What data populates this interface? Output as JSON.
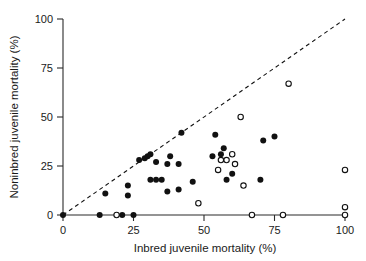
{
  "figure": {
    "background_color": "#ffffff",
    "foreground_color": "#111111"
  },
  "chart_data": {
    "type": "scatter",
    "title": "",
    "xlabel": "Inbred juvenile mortality (%)",
    "ylabel": "Noninbred juvenile mortality (%)",
    "xlim": [
      0,
      100
    ],
    "ylim": [
      0,
      100
    ],
    "xticks": [
      0,
      25,
      50,
      75,
      100
    ],
    "yticks": [
      0,
      25,
      50,
      75,
      100
    ],
    "xtick_labels": [
      "0",
      "25",
      "50",
      "75",
      "100"
    ],
    "ytick_labels": [
      "0",
      "25",
      "50",
      "75",
      "100"
    ],
    "grid": false,
    "legend": "none",
    "annotations": [
      {
        "name": "equality-reference-line",
        "kind": "line",
        "style": "dashed",
        "from": [
          0,
          0
        ],
        "to": [
          100,
          100
        ],
        "description": "1:1 dashed diagonal reference line"
      }
    ],
    "series": [
      {
        "name": "filled-circles",
        "marker": "filled-circle",
        "color": "#111111",
        "points": [
          [
            0,
            0
          ],
          [
            13,
            0
          ],
          [
            21,
            0
          ],
          [
            25,
            0
          ],
          [
            15,
            11
          ],
          [
            23,
            15
          ],
          [
            23,
            10
          ],
          [
            27,
            28
          ],
          [
            29,
            29
          ],
          [
            30,
            30
          ],
          [
            31,
            31
          ],
          [
            31,
            18
          ],
          [
            33,
            27
          ],
          [
            33,
            18
          ],
          [
            35,
            18
          ],
          [
            37,
            26
          ],
          [
            37,
            12
          ],
          [
            38,
            30
          ],
          [
            41,
            26
          ],
          [
            41,
            13
          ],
          [
            42,
            42
          ],
          [
            46,
            17
          ],
          [
            53,
            30
          ],
          [
            54,
            41
          ],
          [
            56,
            31
          ],
          [
            57,
            34
          ],
          [
            58,
            18
          ],
          [
            60,
            21
          ],
          [
            70,
            18
          ],
          [
            71,
            38
          ],
          [
            75,
            40
          ]
        ]
      },
      {
        "name": "open-circles",
        "marker": "open-circle",
        "color": "#ffffff",
        "edge_color": "#111111",
        "points": [
          [
            19,
            0
          ],
          [
            48,
            6
          ],
          [
            55,
            23
          ],
          [
            56,
            28
          ],
          [
            58,
            28
          ],
          [
            60,
            31
          ],
          [
            61,
            26
          ],
          [
            63,
            50
          ],
          [
            64,
            15
          ],
          [
            67,
            0
          ],
          [
            78,
            0
          ],
          [
            80,
            67
          ],
          [
            100,
            23
          ],
          [
            100,
            4
          ],
          [
            100,
            0
          ]
        ]
      }
    ]
  },
  "axes": {
    "x_title": "Inbred juvenile mortality (%)",
    "y_title": "Noninbred juvenile mortality (%)"
  }
}
